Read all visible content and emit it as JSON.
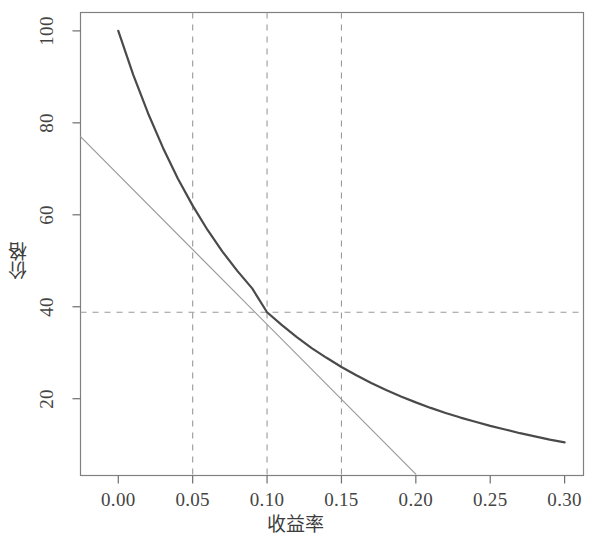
{
  "chart_data": {
    "type": "line",
    "title": "",
    "xlabel": "收益率",
    "ylabel": "价格",
    "xlim": [
      -0.0254,
      0.3127
    ],
    "ylim": [
      3.3,
      104.0
    ],
    "xticks": [
      0.0,
      0.05,
      0.1,
      0.15,
      0.2,
      0.25,
      0.3
    ],
    "xtick_labels": [
      "0.00",
      "0.05",
      "0.10",
      "0.15",
      "0.20",
      "0.25",
      "0.30"
    ],
    "yticks": [
      20,
      40,
      60,
      80,
      100
    ],
    "ytick_labels": [
      "20",
      "40",
      "60",
      "80",
      "100"
    ],
    "grid": false,
    "legend": null,
    "reference_lines": {
      "vertical_dashed_x": [
        0.05,
        0.1,
        0.15
      ],
      "horizontal_dashed_y": [
        38.8
      ],
      "style": "dashed",
      "color": "#999999"
    },
    "series": [
      {
        "name": "price-yield curve",
        "type": "line",
        "color": "#4a4a4a",
        "width": 2.2,
        "x": [
          0.0,
          0.01,
          0.02,
          0.03,
          0.04,
          0.05,
          0.06,
          0.07,
          0.08,
          0.09,
          0.1,
          0.11,
          0.12,
          0.13,
          0.14,
          0.15,
          0.16,
          0.17,
          0.18,
          0.19,
          0.2,
          0.21,
          0.22,
          0.23,
          0.24,
          0.25,
          0.26,
          0.27,
          0.28,
          0.29,
          0.3
        ],
        "y": [
          100.0,
          90.5,
          82.1,
          74.6,
          67.9,
          62.0,
          56.7,
          52.0,
          47.8,
          44.0,
          38.8,
          36.0,
          33.4,
          31.0,
          28.9,
          26.9,
          25.1,
          23.4,
          21.9,
          20.5,
          19.2,
          18.0,
          16.9,
          15.9,
          15.0,
          14.1,
          13.3,
          12.5,
          11.8,
          11.1,
          10.5
        ]
      },
      {
        "name": "tangent line at y=0.10",
        "type": "line",
        "color": "#9a9a9a",
        "width": 1.2,
        "x": [
          -0.0254,
          0.2
        ],
        "y": [
          77.0,
          3.6
        ]
      }
    ],
    "tangent_point": {
      "x": 0.1,
      "y": 38.8
    },
    "box_border": true,
    "box_color": "#7a7a7a"
  }
}
